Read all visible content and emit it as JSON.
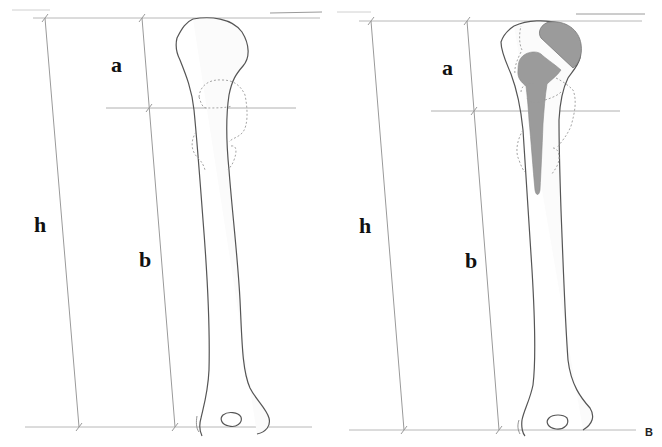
{
  "figure": {
    "panels": [
      {
        "id": "A",
        "panel_label": "",
        "description": "Native humerus with measurement lines",
        "labels": {
          "h": "h",
          "a": "a",
          "b": "b"
        },
        "prosthesis": false
      },
      {
        "id": "B",
        "panel_label": "B",
        "description": "Humerus with shoulder prosthesis (shaded) and measurement lines",
        "labels": {
          "h": "h",
          "a": "a",
          "b": "b"
        },
        "prosthesis": true
      }
    ],
    "colors": {
      "bone_outline": "#555555",
      "measure_line": "#9a9a9a",
      "dashed_outline": "#9a9a9a",
      "prosthesis_fill": "#9b9b9b",
      "bone_fill": "#fbfbfb",
      "label_text": "#111111"
    }
  }
}
